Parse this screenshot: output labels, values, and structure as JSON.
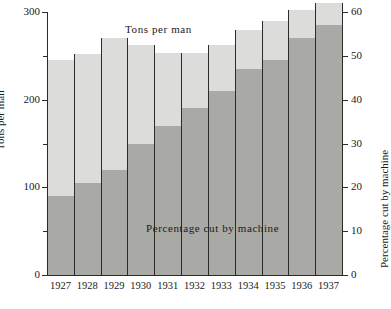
{
  "chart_data": {
    "type": "bar",
    "title": "",
    "subtitle": "",
    "xlabel": "",
    "ylabel": "Tons per man",
    "ylabel_secondary": "Percentage cut by machine",
    "categories": [
      "1927",
      "1928",
      "1929",
      "1930",
      "1931",
      "1932",
      "1933",
      "1934",
      "1935",
      "1936",
      "1937"
    ],
    "ylim": [
      0,
      300
    ],
    "ylim_secondary": [
      0,
      60
    ],
    "yticks": [
      0,
      100,
      200,
      300
    ],
    "yticks_minor": [
      50,
      150,
      250
    ],
    "yticks_secondary": [
      0,
      10,
      20,
      30,
      40,
      50,
      60
    ],
    "grid": false,
    "legend_position": "in-plot",
    "series": [
      {
        "name": "Tons per man",
        "axis": "left",
        "units": "tons",
        "color": "#dcdcda",
        "values": [
          245,
          252,
          270,
          262,
          253,
          253,
          262,
          280,
          290,
          302,
          310
        ]
      },
      {
        "name": "Percentage cut by machine",
        "axis": "right",
        "units": "percent",
        "color": "#a9a9a6",
        "values": [
          18,
          21,
          24,
          30,
          34,
          38,
          42,
          47,
          49,
          54,
          57
        ]
      }
    ],
    "annotations": [
      {
        "text": "Tons per man",
        "position": "upper-center"
      },
      {
        "text": "Percentage cut by machine",
        "position": "lower-center"
      }
    ]
  },
  "axes": {
    "left": {
      "title": "Tons per man",
      "tick_labels": [
        "0",
        "100",
        "200",
        "300"
      ]
    },
    "right": {
      "title": "Percentage cut by machine",
      "tick_labels": [
        "0",
        "10",
        "20",
        "30",
        "40",
        "50",
        "60"
      ]
    },
    "bottom": {
      "tick_labels": [
        "1927",
        "1928",
        "1929",
        "1930",
        "1931",
        "1932",
        "1933",
        "1934",
        "1935",
        "1936",
        "1937"
      ]
    }
  },
  "labels": {
    "tons": "Tons per man",
    "percentage": "Percentage cut by machine"
  },
  "colors": {
    "background": "#ffffff",
    "tons_fill": "#dcdcda",
    "percentage_fill": "#a9a9a6",
    "axis": "#2b2b2b",
    "text": "#1a1a1a"
  }
}
